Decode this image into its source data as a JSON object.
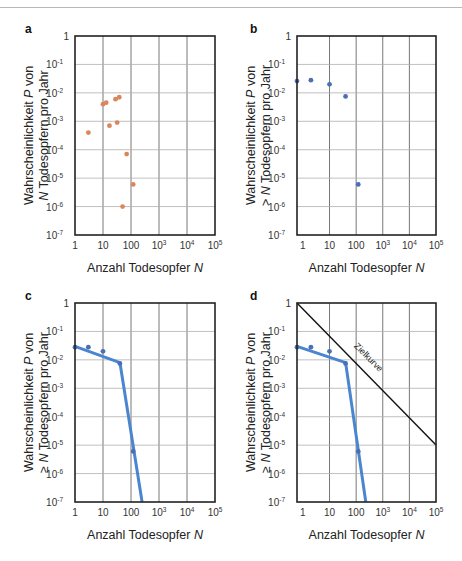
{
  "figure": {
    "colors": {
      "orange_points": "#d9875a",
      "blue_points": "#4a6fb5",
      "blue_line": "#4a86d0",
      "target_line": "#111111",
      "grid": "#b0b0b0",
      "frame": "#222222"
    }
  },
  "chart_data": [
    {
      "panel": "a",
      "type": "scatter",
      "title": "",
      "xlabel": "Anzahl Todesopfer N",
      "ylabel_line1": "Wahrscheinlichkeit P von",
      "ylabel_line2": "N Todesopfern pro Jahr",
      "xscale": "log",
      "yscale": "log",
      "xlim": [
        1,
        100000
      ],
      "ylim": [
        1e-07,
        1
      ],
      "x_ticks": [
        "1",
        "10",
        "100",
        "10^3",
        "10^4",
        "10^5"
      ],
      "y_ticks": [
        "1",
        "10^-1",
        "10^-2",
        "10^-3",
        "10^-4",
        "10^-5",
        "10^-6",
        "10^-7"
      ],
      "grid": true,
      "series": [
        {
          "name": "Beobachtungen",
          "color": "#d9875a",
          "points": [
            {
              "x": 3,
              "y": 0.0004
            },
            {
              "x": 10,
              "y": 0.004
            },
            {
              "x": 13,
              "y": 0.0045
            },
            {
              "x": 28,
              "y": 0.006
            },
            {
              "x": 38,
              "y": 0.007
            },
            {
              "x": 17,
              "y": 0.0007
            },
            {
              "x": 32,
              "y": 0.0009
            },
            {
              "x": 70,
              "y": 7e-05
            },
            {
              "x": 120,
              "y": 6e-06
            },
            {
              "x": 50,
              "y": 1e-06
            }
          ]
        }
      ]
    },
    {
      "panel": "b",
      "type": "scatter",
      "title": "",
      "xlabel": "Anzahl Todesopfer N",
      "ylabel_line1": "Wahrscheinlichkeit P von",
      "ylabel_line2": "> N Todesopfern pro Jahr",
      "xscale": "log",
      "yscale": "log",
      "xlim": [
        0.6,
        100000
      ],
      "ylim": [
        1e-07,
        1
      ],
      "x_ticks": [
        "1",
        "10",
        "100",
        "10^3",
        "10^4",
        "10^5"
      ],
      "y_ticks": [
        "1",
        "10^-1",
        "10^-2",
        "10^-3",
        "10^-4",
        "10^-5",
        "10^-6",
        "10^-7"
      ],
      "grid": true,
      "series": [
        {
          "name": "Überschreitung",
          "color": "#4a6fb5",
          "points": [
            {
              "x": 0.6,
              "y": 0.026
            },
            {
              "x": 2,
              "y": 0.028
            },
            {
              "x": 10,
              "y": 0.02
            },
            {
              "x": 40,
              "y": 0.0075
            },
            {
              "x": 120,
              "y": 6e-06
            }
          ]
        }
      ]
    },
    {
      "panel": "c",
      "type": "line",
      "title": "",
      "xlabel": "Anzahl Todesopfer N",
      "ylabel_line1": "Wahrscheinlichkeit P von",
      "ylabel_line2": "≥ N Todesopfern pro Jahr",
      "xscale": "log",
      "yscale": "log",
      "xlim": [
        1,
        100000
      ],
      "ylim": [
        1e-07,
        1
      ],
      "x_ticks": [
        "1",
        "10",
        "100",
        "10^3",
        "10^4",
        "10^5"
      ],
      "y_ticks": [
        "1",
        "10^-1",
        "10^-2",
        "10^-3",
        "10^-4",
        "10^-5",
        "10^-6",
        "10^-7"
      ],
      "grid": true,
      "series": [
        {
          "name": "Datenpunkte",
          "color": "#4a6fb5",
          "points": [
            {
              "x": 1,
              "y": 0.028
            },
            {
              "x": 3,
              "y": 0.028
            },
            {
              "x": 10,
              "y": 0.02
            },
            {
              "x": 40,
              "y": 0.0075
            },
            {
              "x": 120,
              "y": 6e-06
            }
          ]
        },
        {
          "name": "FN-Kurve",
          "color": "#4a86d0",
          "line": [
            {
              "x": 1,
              "y": 0.03
            },
            {
              "x": 40,
              "y": 0.008
            },
            {
              "x": 250,
              "y": 1e-07
            }
          ]
        }
      ]
    },
    {
      "panel": "d",
      "type": "line",
      "title": "",
      "xlabel": "Anzahl Todesopfer N",
      "ylabel_line1": "Wahrscheinlichkeit P von",
      "ylabel_line2": "≥ N Todesopfern pro Jahr",
      "xscale": "log",
      "yscale": "log",
      "xlim": [
        0.6,
        100000
      ],
      "ylim": [
        1e-07,
        1
      ],
      "x_ticks": [
        "1",
        "10",
        "100",
        "10^3",
        "10^4",
        "10^5"
      ],
      "y_ticks": [
        "1",
        "10^-1",
        "10^-2",
        "10^-3",
        "10^-4",
        "10^-5",
        "10^-6",
        "10^-7"
      ],
      "grid": true,
      "annotation": "Zielkurve",
      "series": [
        {
          "name": "Datenpunkte",
          "color": "#4a6fb5",
          "points": [
            {
              "x": 0.6,
              "y": 0.028
            },
            {
              "x": 2,
              "y": 0.028
            },
            {
              "x": 10,
              "y": 0.02
            },
            {
              "x": 40,
              "y": 0.0075
            },
            {
              "x": 120,
              "y": 6e-06
            }
          ]
        },
        {
          "name": "FN-Kurve",
          "color": "#4a86d0",
          "line": [
            {
              "x": 0.6,
              "y": 0.03
            },
            {
              "x": 40,
              "y": 0.008
            },
            {
              "x": 230,
              "y": 1e-07
            }
          ]
        },
        {
          "name": "Zielkurve",
          "color": "#111111",
          "line": [
            {
              "x": 0.6,
              "y": 1
            },
            {
              "x": 100000,
              "y": 1e-05
            }
          ]
        }
      ]
    }
  ],
  "panels": [
    {
      "letter": "a"
    },
    {
      "letter": "b"
    },
    {
      "letter": "c"
    },
    {
      "letter": "d"
    }
  ]
}
